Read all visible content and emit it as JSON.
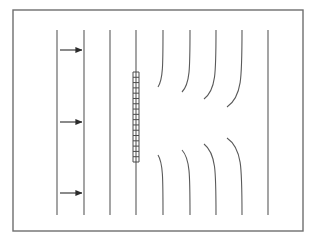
{
  "figure": {
    "title": "",
    "caption": "",
    "background_color": "#ffffff",
    "line_color": "#5a5a5a",
    "frame_color": "#6e6e6e",
    "arrow_color": "#2b2b2b",
    "barrier_color": "#4a4a4a"
  },
  "frame": {
    "name": "figure-border",
    "x": 13,
    "y": 10,
    "width": 290,
    "height": 221,
    "stroke_width": 1.4
  },
  "chart_data": {
    "type": "line",
    "title": "",
    "xlabel": "",
    "ylabel": "",
    "xlim": [
      13,
      303
    ],
    "ylim": [
      10,
      231
    ],
    "grid": false,
    "legend": null,
    "series": [
      {
        "name": "streamline-1",
        "x_top": 57,
        "x_bottom": 57,
        "y_top": 30,
        "y_bottom": 215,
        "gap_top": null,
        "gap_bottom": null,
        "curvature": 0,
        "straight": true
      },
      {
        "name": "streamline-2",
        "x_top": 84,
        "x_bottom": 84,
        "y_top": 30,
        "y_bottom": 215,
        "gap_top": null,
        "gap_bottom": null,
        "curvature": 0,
        "straight": true
      },
      {
        "name": "streamline-3",
        "x_top": 110,
        "x_bottom": 110,
        "y_top": 30,
        "y_bottom": 215,
        "gap_top": null,
        "gap_bottom": null,
        "curvature": 0,
        "straight": true
      },
      {
        "name": "streamline-4",
        "x_top": 136,
        "x_bottom": 136,
        "y_top": 30,
        "y_bottom": 215,
        "gap_top": null,
        "gap_bottom": null,
        "curvature": 0,
        "straight": true
      },
      {
        "name": "streamline-5",
        "x_top": 163,
        "x_bottom": 163,
        "y_top": 30,
        "y_bottom": 215,
        "gap_top": 87,
        "gap_bottom": 155,
        "curvature": 5,
        "straight": false
      },
      {
        "name": "streamline-6",
        "x_top": 190,
        "x_bottom": 190,
        "y_top": 30,
        "y_bottom": 215,
        "gap_top": 92,
        "gap_bottom": 150,
        "curvature": 8,
        "straight": false
      },
      {
        "name": "streamline-7",
        "x_top": 216,
        "x_bottom": 216,
        "y_top": 30,
        "y_bottom": 215,
        "gap_top": 99,
        "gap_bottom": 144,
        "curvature": 12,
        "straight": false
      },
      {
        "name": "streamline-8",
        "x_top": 242,
        "x_bottom": 242,
        "y_top": 30,
        "y_bottom": 215,
        "gap_top": 107,
        "gap_bottom": 138,
        "curvature": 15,
        "straight": false
      },
      {
        "name": "streamline-9",
        "x_top": 268,
        "x_bottom": 268,
        "y_top": 30,
        "y_bottom": 215,
        "gap_top": null,
        "gap_bottom": null,
        "curvature": 0,
        "straight": true
      }
    ],
    "barrier": {
      "name": "hatched-barrier",
      "x": 136,
      "y_top": 72,
      "y_bottom": 162,
      "rung_count": 17,
      "width": 6,
      "style": "hatched"
    },
    "arrows": [
      {
        "name": "flow-arrow-top",
        "x_start": 60,
        "x_end": 82,
        "y": 50,
        "direction": "right",
        "label": ""
      },
      {
        "name": "flow-arrow-middle",
        "x_start": 60,
        "x_end": 82,
        "y": 122,
        "direction": "right",
        "label": ""
      },
      {
        "name": "flow-arrow-bottom",
        "x_start": 60,
        "x_end": 82,
        "y": 193,
        "direction": "right",
        "label": ""
      }
    ]
  }
}
